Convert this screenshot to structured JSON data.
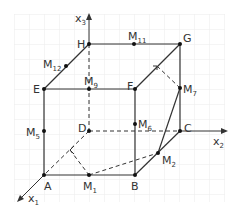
{
  "colors": {
    "grid": "#ebebeb",
    "line": "#333333",
    "text": "#333333",
    "background": "#ffffff"
  },
  "axes": [
    {
      "id": "x1",
      "label": "x",
      "sub": "1"
    },
    {
      "id": "x2",
      "label": "x",
      "sub": "2"
    },
    {
      "id": "x3",
      "label": "x",
      "sub": "3"
    }
  ],
  "vertices": [
    {
      "name": "A",
      "label": "A"
    },
    {
      "name": "B",
      "label": "B"
    },
    {
      "name": "C",
      "label": "C"
    },
    {
      "name": "D",
      "label": "D"
    },
    {
      "name": "E",
      "label": "E"
    },
    {
      "name": "F",
      "label": "F"
    },
    {
      "name": "G",
      "label": "G"
    },
    {
      "name": "H",
      "label": "H"
    }
  ],
  "midpoints": [
    {
      "name": "M1",
      "label": "M",
      "sub": "1"
    },
    {
      "name": "M2",
      "label": "M",
      "sub": "2"
    },
    {
      "name": "M5",
      "label": "M",
      "sub": "5"
    },
    {
      "name": "M6",
      "label": "M",
      "sub": "6"
    },
    {
      "name": "M7",
      "label": "M",
      "sub": "7"
    },
    {
      "name": "M9",
      "label": "M",
      "sub": "9"
    },
    {
      "name": "M11",
      "label": "M",
      "sub": "11"
    },
    {
      "name": "M12",
      "label": "M",
      "sub": "12"
    }
  ]
}
